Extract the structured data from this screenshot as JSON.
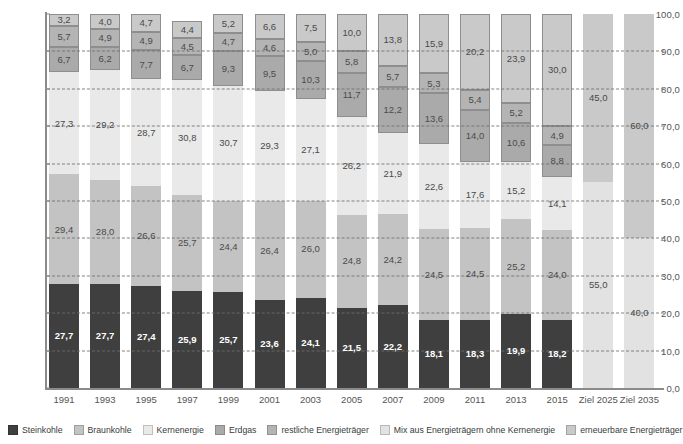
{
  "chart_data": {
    "type": "bar",
    "subtype": "stacked-bar-100-percent",
    "title": "",
    "xlabel": "",
    "ylabel": "",
    "ylim": [
      0,
      100
    ],
    "ytick_labels": [
      "0,0",
      "10,0",
      "20,0",
      "30,0",
      "40,0",
      "50,0",
      "60,0",
      "70,0",
      "80,0",
      "90,0",
      "100,0"
    ],
    "ytick_values": [
      0,
      10,
      20,
      30,
      40,
      50,
      60,
      70,
      80,
      90,
      100
    ],
    "grid": true,
    "grid_style": "dashed-horizontal",
    "legend_position": "bottom",
    "decimal_separator": ",",
    "categories": [
      "1991",
      "1993",
      "1995",
      "1997",
      "1999",
      "2001",
      "2003",
      "2005",
      "2007",
      "2009",
      "2011",
      "2013",
      "2015",
      "Ziel 2025",
      "Ziel 2035"
    ],
    "series": [
      {
        "name": "Steinkohle",
        "color": "#3f3f3f",
        "values": [
          27.7,
          27.7,
          27.4,
          25.9,
          25.7,
          23.6,
          24.1,
          21.5,
          22.2,
          18.1,
          18.3,
          19.9,
          18.2,
          null,
          null
        ],
        "labels": [
          "27,7",
          "27,7",
          "27,4",
          "25,9",
          "25,7",
          "23,6",
          "24,1",
          "21,5",
          "22,2",
          "18,1",
          "18,3",
          "19,9",
          "18,2",
          "",
          ""
        ]
      },
      {
        "name": "Braunkohle",
        "color": "#c3c3c3",
        "values": [
          29.4,
          28.0,
          26.6,
          25.7,
          24.4,
          26.4,
          26.0,
          24.8,
          24.2,
          24.5,
          24.5,
          25.2,
          24.0,
          null,
          null
        ],
        "labels": [
          "29,4",
          "28,0",
          "26,6",
          "25,7",
          "24,4",
          "26,4",
          "26,0",
          "24,8",
          "24,2",
          "24,5",
          "24,5",
          "25,2",
          "24,0",
          "",
          ""
        ]
      },
      {
        "name": "Kernenergie",
        "color": "#e9e9e9",
        "values": [
          27.3,
          29.2,
          28.7,
          30.8,
          30.7,
          29.3,
          27.1,
          26.2,
          21.9,
          22.6,
          17.6,
          15.2,
          14.1,
          null,
          null
        ],
        "labels": [
          "27,3",
          "29,2",
          "28,7",
          "30,8",
          "30,7",
          "29,3",
          "27,1",
          "26,2",
          "21,9",
          "22,6",
          "17,6",
          "15,2",
          "14,1",
          "",
          ""
        ]
      },
      {
        "name": "Erdgas",
        "color": "#aaaaaa",
        "values": [
          6.7,
          6.2,
          7.7,
          6.7,
          9.3,
          9.5,
          10.3,
          11.7,
          12.2,
          13.6,
          14.0,
          10.6,
          8.8,
          null,
          null
        ],
        "labels": [
          "6,7",
          "6,2",
          "7,7",
          "6,7",
          "9,3",
          "9,5",
          "10,3",
          "11,7",
          "12,2",
          "13,6",
          "14,0",
          "10,6",
          "8,8",
          "",
          ""
        ]
      },
      {
        "name": "restliche Energieträger",
        "color": "#b4b4b4",
        "values": [
          5.7,
          4.9,
          4.9,
          4.5,
          4.7,
          4.6,
          5.0,
          5.8,
          5.7,
          5.3,
          5.4,
          5.2,
          4.9,
          null,
          null
        ],
        "labels": [
          "5,7",
          "4,9",
          "4,9",
          "4,5",
          "4,7",
          "4,6",
          "5,0",
          "5,8",
          "5,7",
          "5,3",
          "5,4",
          "5,2",
          "4,9",
          "",
          ""
        ]
      },
      {
        "name": "Mix aus Energieträgern ohne Kernenergie",
        "color": "#e2e2e2",
        "values": [
          null,
          null,
          null,
          null,
          null,
          null,
          null,
          null,
          null,
          null,
          null,
          null,
          null,
          55.0,
          40.0
        ],
        "labels": [
          "",
          "",
          "",
          "",
          "",
          "",
          "",
          "",
          "",
          "",
          "",
          "",
          "",
          "55,0",
          "40,0"
        ]
      },
      {
        "name": "erneuerbare Energieträger",
        "color": "#c9c9c9",
        "values": [
          3.2,
          4.0,
          4.7,
          4.4,
          5.2,
          6.6,
          7.5,
          10.0,
          13.8,
          15.9,
          20.2,
          23.9,
          30.0,
          45.0,
          60.0
        ],
        "labels": [
          "3,2",
          "4,0",
          "4,7",
          "4,4",
          "5,2",
          "6,6",
          "7,5",
          "10,0",
          "13,8",
          "15,9",
          "20,2",
          "23,9",
          "30,0",
          "45,0",
          "60,0"
        ]
      }
    ]
  },
  "legend": {
    "items": [
      {
        "label": "Steinkohle",
        "color": "#3f3f3f"
      },
      {
        "label": "Braunkohle",
        "color": "#c3c3c3"
      },
      {
        "label": "Kernenergie",
        "color": "#e9e9e9"
      },
      {
        "label": "Erdgas",
        "color": "#aaaaaa"
      },
      {
        "label": "restliche Energieträger",
        "color": "#b4b4b4"
      },
      {
        "label": "Mix aus Energieträgern ohne Kernenergie",
        "color": "#e2e2e2"
      },
      {
        "label": "erneuerbare Energieträger",
        "color": "#c9c9c9"
      }
    ]
  }
}
